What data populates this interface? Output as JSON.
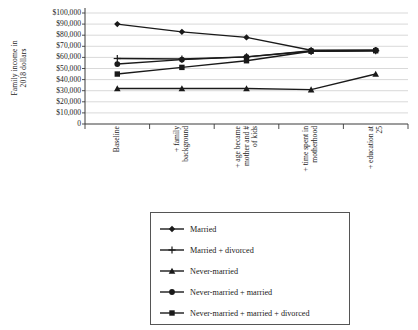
{
  "chart_data": {
    "type": "line",
    "title": "",
    "xlabel": "",
    "ylabel": "Family income in 2018 dollars",
    "ylabel_lines": [
      "Family income in",
      "2018 dollars"
    ],
    "categories": [
      "Baseline",
      "+ family background",
      "+ age became mother and # of kids",
      "+ time spent in motherhood",
      "+ education at 25"
    ],
    "category_lines": [
      [
        "Baseline"
      ],
      [
        "+ family",
        "background"
      ],
      [
        "+ age became",
        "mother and #",
        "of kids"
      ],
      [
        "+ time spent in",
        "motherhood"
      ],
      [
        "+ education at",
        "25"
      ]
    ],
    "ylim": [
      0,
      100000
    ],
    "ytick_values": [
      0,
      10000,
      20000,
      30000,
      40000,
      50000,
      60000,
      70000,
      80000,
      90000,
      100000
    ],
    "ytick_labels": [
      "0",
      "$10,000",
      "$20,000",
      "$30,000",
      "$40,000",
      "$50,000",
      "$60,000",
      "$70,000",
      "$80,000",
      "$90,000",
      "$100,000"
    ],
    "grid": true,
    "legend_position": "bottom",
    "series": [
      {
        "name": "Married",
        "marker": "diamond",
        "values": [
          90000,
          83000,
          78000,
          66500,
          66500
        ]
      },
      {
        "name": "Married + divorced",
        "marker": "plus",
        "values": [
          59000,
          58500,
          60500,
          65500,
          66000
        ]
      },
      {
        "name": "Never-married",
        "marker": "triangle",
        "values": [
          32000,
          32000,
          32000,
          31000,
          45000
        ]
      },
      {
        "name": "Never-married + married",
        "marker": "circle",
        "values": [
          54000,
          58000,
          60500,
          66000,
          66500
        ]
      },
      {
        "name": "Never-married + married + divorced",
        "marker": "square",
        "values": [
          45000,
          51000,
          57000,
          65500,
          66000
        ]
      }
    ],
    "series_color": "#1a1a1a"
  }
}
